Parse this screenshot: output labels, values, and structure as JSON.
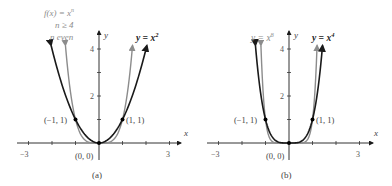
{
  "chart_data": [
    {
      "panel": "a",
      "type": "line",
      "caption": "(a)",
      "xlabel": "x",
      "ylabel": "y",
      "xlim": [
        -3,
        3
      ],
      "ylim": [
        0,
        4.2
      ],
      "xticks": [
        -3,
        -2,
        -1,
        0,
        1,
        2,
        3
      ],
      "xtick_labels": {
        "-3": "−3",
        "3": "3"
      },
      "yticks": [
        1,
        2,
        3,
        4
      ],
      "ytick_labels": {
        "2": "2",
        "4": "4"
      },
      "grid": false,
      "series": [
        {
          "name": "y = x^2",
          "label": "y = x",
          "label_sup": "2",
          "color": "#1a1a1a",
          "formula": "x^2"
        },
        {
          "name": "f(x) = x^n, n >= 4, n even",
          "label_lines": [
            "f(x) = x",
            "n ≥ 4",
            "n even"
          ],
          "label_sup": "n",
          "color": "#8c8c8c",
          "formula": "x^4"
        }
      ],
      "points": [
        {
          "x": -1,
          "y": 1,
          "label": "(−1, 1)"
        },
        {
          "x": 0,
          "y": 0,
          "label": "(0, 0)"
        },
        {
          "x": 1,
          "y": 1,
          "label": "(1, 1)"
        }
      ]
    },
    {
      "panel": "b",
      "type": "line",
      "caption": "(b)",
      "xlabel": "x",
      "ylabel": "y",
      "xlim": [
        -3,
        3
      ],
      "ylim": [
        0,
        4.2
      ],
      "xticks": [
        -3,
        -2,
        -1,
        0,
        1,
        2,
        3
      ],
      "xtick_labels": {
        "-3": "−3",
        "3": "3"
      },
      "yticks": [
        1,
        2,
        3,
        4
      ],
      "ytick_labels": {
        "2": "2",
        "4": "4"
      },
      "grid": false,
      "series": [
        {
          "name": "y = x^4",
          "label": "y = x",
          "label_sup": "4",
          "color": "#1a1a1a",
          "formula": "x^4"
        },
        {
          "name": "y = x^8",
          "label": "y = x",
          "label_sup": "8",
          "color": "#8c8c8c",
          "formula": "x^8"
        }
      ],
      "points": [
        {
          "x": -1,
          "y": 1,
          "label": "(−1, 1)"
        },
        {
          "x": 0,
          "y": 0,
          "label": "(0, 0)"
        },
        {
          "x": 1,
          "y": 1,
          "label": "(1, 1)"
        }
      ]
    }
  ]
}
